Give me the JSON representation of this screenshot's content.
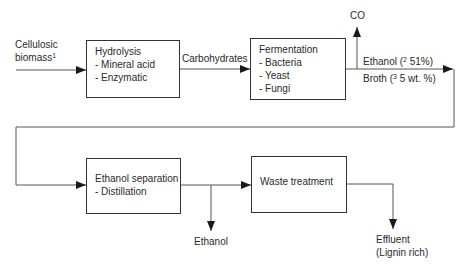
{
  "diagram": {
    "type": "process-flow",
    "input": {
      "line1": "Cellulosic",
      "line2": "biomass",
      "footnote": "1"
    },
    "boxes": {
      "hydrolysis": {
        "title": "Hydrolysis",
        "items": [
          "- Mineral acid",
          "- Enzymatic"
        ]
      },
      "fermentation": {
        "title": "Fermentation",
        "items": [
          "- Bacteria",
          "- Yeast",
          "- Fungi"
        ]
      },
      "separation": {
        "title": "Ethanol separation",
        "items": [
          "- Distillation"
        ]
      },
      "waste": {
        "title": "Waste treatment"
      }
    },
    "edges": {
      "carbohydrates": "Carbohydrates",
      "co": "CO",
      "ethanol_yield": {
        "prefix": "Ethanol (",
        "footnote": "2",
        "value": " 51%)"
      },
      "broth": {
        "prefix": "Broth (",
        "footnote": "3",
        "value": " 5 wt. %)"
      },
      "ethanol_out": "Ethanol",
      "effluent_line1": "Effluent",
      "effluent_line2": "(Lignin rich)"
    },
    "colors": {
      "line": "#555555",
      "box_border": "#333333",
      "text": "#2a2a2a"
    }
  }
}
